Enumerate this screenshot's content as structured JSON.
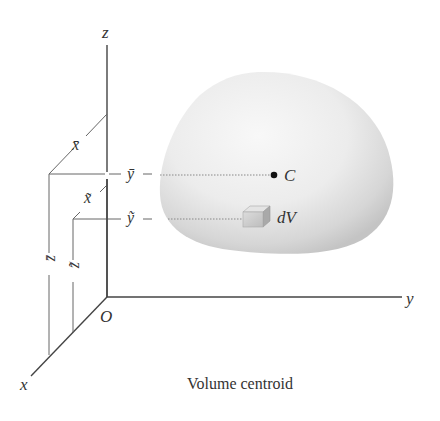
{
  "diagram": {
    "title": "Volume centroid",
    "axes": {
      "z_label": "z",
      "y_label": "y",
      "x_label": "x",
      "origin_label": "O"
    },
    "centroid": {
      "point_label": "C",
      "x_coord_label": "x̄",
      "y_coord_label": "ȳ",
      "z_coord_label": "z̄"
    },
    "element": {
      "label": "dV",
      "x_coord_label": "x̃",
      "y_coord_label": "ỹ",
      "z_coord_label": "z̃"
    },
    "colors": {
      "line": "#444444",
      "guide": "#777777",
      "body_light": "#f6f6f6",
      "body_shade": "#c8c8c8",
      "text": "#333333"
    }
  }
}
